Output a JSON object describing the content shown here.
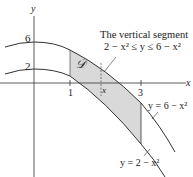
{
  "figure": {
    "axis_x_label": "x",
    "axis_y_label": "y",
    "tick_y_6": "6",
    "tick_y_2": "2",
    "tick_x_1": "1",
    "tick_x_3": "3",
    "region_label": "𝒟",
    "segment_x_label": "x",
    "annotation_line1": "The vertical segment",
    "annotation_line2": "2 − x² ≤ y ≤ 6 − x²",
    "curve_upper_label": "y = 6 − x²",
    "curve_lower_label": "y = 2 − x²",
    "colors": {
      "region_fill": "#d9d9d9",
      "curve": "#333333",
      "axis": "#333333",
      "text": "#222222"
    }
  }
}
